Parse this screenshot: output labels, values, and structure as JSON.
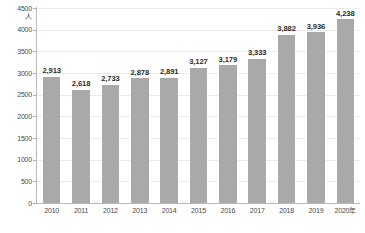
{
  "chart_data": {
    "type": "bar",
    "title": "",
    "xlabel": "",
    "ylabel": "人",
    "unit": "人",
    "categories": [
      "2010",
      "2011",
      "2012",
      "2013",
      "2014",
      "2015",
      "2016",
      "2017",
      "2018",
      "2019",
      "2020年"
    ],
    "values": [
      2913,
      2618,
      2733,
      2878,
      2891,
      3127,
      3179,
      3333,
      3882,
      3936,
      4238
    ],
    "value_labels": [
      "2,913",
      "2,618",
      "2,733",
      "2,878",
      "2,891",
      "3,127",
      "3,179",
      "3,333",
      "3,882",
      "3,936",
      "4,238"
    ],
    "ylim": [
      0,
      4500
    ],
    "ytick_values": [
      0,
      500,
      1000,
      1500,
      2000,
      2500,
      3000,
      3500,
      4000,
      4500
    ],
    "ytick_labels": [
      "0",
      "500",
      "1000",
      "1500",
      "2000",
      "2500",
      "3000",
      "3500",
      "4000",
      "4500"
    ],
    "grid": true,
    "legend": false,
    "legend_position": "none",
    "series": [
      {
        "name": "人数",
        "values": [
          2913,
          2618,
          2733,
          2878,
          2891,
          3127,
          3179,
          3333,
          3882,
          3936,
          4238
        ],
        "color": "#a9a9a9"
      }
    ]
  },
  "colors": {
    "bar": "#a9a9a9",
    "gridline": "#ececec",
    "axis": "#b9b9b9",
    "label_text": "#2b2b2b",
    "tick_text": "#4a4a4a",
    "background": "#ffffff"
  },
  "footnote": ""
}
